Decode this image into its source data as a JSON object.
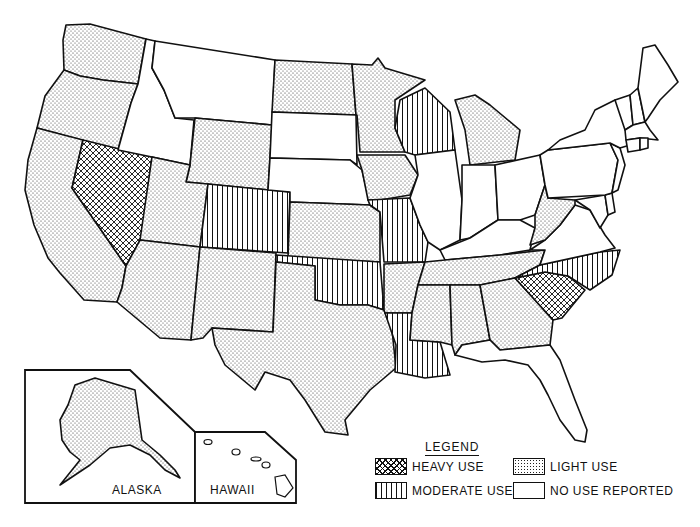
{
  "map": {
    "type": "choropleth",
    "region": "United States",
    "legend": {
      "title": "LEGEND",
      "items": [
        {
          "key": "heavy",
          "label": "HEAVY USE",
          "pattern": "crosshatch"
        },
        {
          "key": "light",
          "label": "LIGHT USE",
          "pattern": "stipple"
        },
        {
          "key": "moderate",
          "label": "MODERATE USE",
          "pattern": "vertical-lines"
        },
        {
          "key": "none",
          "label": "NO USE REPORTED",
          "pattern": "blank"
        }
      ]
    },
    "insets": {
      "alaska": {
        "label": "ALASKA",
        "category": "light"
      },
      "hawaii": {
        "label": "HAWAII",
        "category": "none"
      }
    },
    "states": {
      "WA": "light",
      "OR": "light",
      "CA": "light",
      "NV": "heavy",
      "ID": "none",
      "MT": "none",
      "WY": "light",
      "UT": "light",
      "AZ": "light",
      "CO": "moderate",
      "NM": "light",
      "ND": "light",
      "SD": "none",
      "NE": "none",
      "KS": "light",
      "OK": "moderate",
      "TX": "light",
      "MN": "light",
      "IA": "light",
      "MO": "moderate",
      "AR": "light",
      "LA": "moderate",
      "WI": "moderate",
      "IL": "none",
      "MI": "light",
      "IN": "none",
      "OH": "none",
      "KY": "none",
      "TN": "light",
      "MS": "light",
      "AL": "light",
      "GA": "light",
      "FL": "none",
      "SC": "heavy",
      "NC": "moderate",
      "VA": "none",
      "WV": "light",
      "MD": "none",
      "DE": "none",
      "PA": "none",
      "NJ": "none",
      "NY": "none",
      "CT": "none",
      "RI": "none",
      "MA": "none",
      "VT": "none",
      "NH": "none",
      "ME": "none",
      "AK": "light",
      "HI": "none"
    },
    "summary": {
      "heavy": [
        "NV",
        "SC"
      ],
      "moderate": [
        "CO",
        "OK",
        "MO",
        "LA",
        "WI",
        "NC"
      ],
      "light": [
        "WA",
        "OR",
        "CA",
        "WY",
        "UT",
        "AZ",
        "NM",
        "ND",
        "KS",
        "TX",
        "MN",
        "IA",
        "AR",
        "MI",
        "TN",
        "MS",
        "AL",
        "GA",
        "WV",
        "AK"
      ],
      "none": [
        "ID",
        "MT",
        "SD",
        "NE",
        "IL",
        "IN",
        "OH",
        "KY",
        "FL",
        "VA",
        "MD",
        "DE",
        "PA",
        "NJ",
        "NY",
        "CT",
        "RI",
        "MA",
        "VT",
        "NH",
        "ME",
        "HI"
      ]
    }
  }
}
